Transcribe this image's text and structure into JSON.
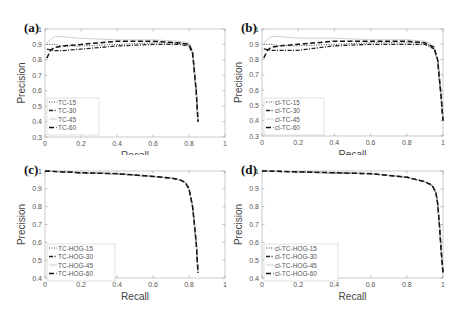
{
  "figure": {
    "panels": [
      {
        "id": "a",
        "label": "(a)",
        "xlabel": "Recall",
        "ylabel": "Precision",
        "ylim": [
          0.3,
          1
        ],
        "yticks": [
          "0.3",
          "0.4",
          "0.5",
          "0.6",
          "0.7",
          "0.8",
          "0.9",
          "1"
        ],
        "xticks": [
          "0",
          "0.2",
          "0.4",
          "0.6",
          "0.8",
          "1"
        ],
        "legend": [
          "TC-15",
          "TC-30",
          "TC-45",
          "TC-60"
        ]
      },
      {
        "id": "b",
        "label": "(b)",
        "xlabel": "Recall",
        "ylabel": "Precision",
        "ylim": [
          0.3,
          1
        ],
        "yticks": [
          "0.3",
          "0.4",
          "0.5",
          "0.6",
          "0.7",
          "0.8",
          "0.9",
          "1"
        ],
        "xticks": [
          "0",
          "0.2",
          "0.4",
          "0.6",
          "0.8",
          "1"
        ],
        "legend": [
          "cl-TC-15",
          "cl-TC-30",
          "cl-TC-45",
          "cl-TC-60"
        ]
      },
      {
        "id": "c",
        "label": "(c)",
        "xlabel": "Recall",
        "ylabel": "Precision",
        "ylim": [
          0.4,
          1
        ],
        "yticks": [
          "0.4",
          "0.5",
          "0.6",
          "0.7",
          "0.8",
          "0.9",
          "1"
        ],
        "xticks": [
          "0",
          "0.2",
          "0.4",
          "0.6",
          "0.8",
          "1"
        ],
        "legend": [
          "TC-HOG-15",
          "TC-HOG-30",
          "TC-HOG-45",
          "TC-HOG-60"
        ]
      },
      {
        "id": "d",
        "label": "(d)",
        "xlabel": "Recall",
        "ylabel": "Precision",
        "ylim": [
          0.4,
          1
        ],
        "yticks": [
          "0.4",
          "0.5",
          "0.6",
          "0.7",
          "0.8",
          "0.9",
          "1"
        ],
        "xticks": [
          "0",
          "0.2",
          "0.4",
          "0.6",
          "0.8",
          "1"
        ],
        "legend": [
          "cl-TC-HOG-15",
          "cl-TC-HOG-30",
          "cl-TC-HOG-45",
          "cl-TC-HOG-60"
        ]
      }
    ]
  },
  "chart_data": [
    {
      "type": "line",
      "title": "(a)",
      "xlabel": "Recall",
      "ylabel": "Precision",
      "xlim": [
        0,
        1
      ],
      "ylim": [
        0.3,
        1
      ],
      "grid": false,
      "legend_position": "lower left",
      "series": [
        {
          "name": "TC-15",
          "style": "dotted",
          "x": [
            0.01,
            0.05,
            0.1,
            0.2,
            0.4,
            0.6,
            0.75,
            0.8,
            0.82,
            0.84,
            0.85
          ],
          "y": [
            0.9,
            0.9,
            0.89,
            0.89,
            0.9,
            0.91,
            0.91,
            0.9,
            0.85,
            0.6,
            0.4
          ]
        },
        {
          "name": "TC-30",
          "style": "dashdot",
          "x": [
            0.01,
            0.05,
            0.1,
            0.2,
            0.4,
            0.6,
            0.75,
            0.8,
            0.82,
            0.84,
            0.85
          ],
          "y": [
            0.87,
            0.86,
            0.86,
            0.87,
            0.89,
            0.9,
            0.9,
            0.89,
            0.84,
            0.6,
            0.4
          ]
        },
        {
          "name": "TC-45",
          "style": "solid-light",
          "x": [
            0.01,
            0.05,
            0.1,
            0.2,
            0.4,
            0.6,
            0.75,
            0.8,
            0.82,
            0.84,
            0.85
          ],
          "y": [
            0.91,
            0.95,
            0.95,
            0.94,
            0.93,
            0.93,
            0.92,
            0.91,
            0.86,
            0.6,
            0.4
          ]
        },
        {
          "name": "TC-60",
          "style": "dashed",
          "x": [
            0.01,
            0.03,
            0.05,
            0.1,
            0.2,
            0.4,
            0.6,
            0.75,
            0.8,
            0.82,
            0.84,
            0.85
          ],
          "y": [
            0.81,
            0.86,
            0.88,
            0.89,
            0.9,
            0.92,
            0.92,
            0.91,
            0.9,
            0.85,
            0.6,
            0.4
          ]
        }
      ]
    },
    {
      "type": "line",
      "title": "(b)",
      "xlabel": "Recall",
      "ylabel": "Precision",
      "xlim": [
        0,
        1
      ],
      "ylim": [
        0.3,
        1
      ],
      "grid": false,
      "legend_position": "lower left",
      "series": [
        {
          "name": "cl-TC-15",
          "style": "dotted",
          "x": [
            0.01,
            0.05,
            0.1,
            0.2,
            0.4,
            0.6,
            0.8,
            0.9,
            0.95,
            0.97,
            0.99,
            1.0
          ],
          "y": [
            0.9,
            0.9,
            0.89,
            0.89,
            0.9,
            0.91,
            0.91,
            0.91,
            0.88,
            0.8,
            0.55,
            0.4
          ]
        },
        {
          "name": "cl-TC-30",
          "style": "dashdot",
          "x": [
            0.01,
            0.05,
            0.1,
            0.2,
            0.4,
            0.6,
            0.8,
            0.9,
            0.95,
            0.97,
            0.99,
            1.0
          ],
          "y": [
            0.87,
            0.86,
            0.86,
            0.86,
            0.89,
            0.9,
            0.9,
            0.9,
            0.87,
            0.8,
            0.55,
            0.4
          ]
        },
        {
          "name": "cl-TC-45",
          "style": "solid-light",
          "x": [
            0.01,
            0.05,
            0.1,
            0.2,
            0.4,
            0.6,
            0.8,
            0.9,
            0.95,
            0.97,
            0.99,
            1.0
          ],
          "y": [
            0.91,
            0.95,
            0.95,
            0.94,
            0.94,
            0.93,
            0.93,
            0.92,
            0.89,
            0.8,
            0.55,
            0.4
          ]
        },
        {
          "name": "cl-TC-60",
          "style": "dashed",
          "x": [
            0.01,
            0.03,
            0.05,
            0.1,
            0.2,
            0.4,
            0.6,
            0.8,
            0.9,
            0.95,
            0.97,
            0.99,
            1.0
          ],
          "y": [
            0.81,
            0.86,
            0.88,
            0.89,
            0.9,
            0.92,
            0.92,
            0.92,
            0.91,
            0.88,
            0.8,
            0.55,
            0.4
          ]
        }
      ]
    },
    {
      "type": "line",
      "title": "(c)",
      "xlabel": "Recall",
      "ylabel": "Precision",
      "xlim": [
        0,
        1
      ],
      "ylim": [
        0.4,
        1
      ],
      "grid": false,
      "legend_position": "lower left",
      "series": [
        {
          "name": "TC-HOG-15",
          "style": "dotted",
          "x": [
            0.0,
            0.1,
            0.2,
            0.4,
            0.6,
            0.7,
            0.75,
            0.78,
            0.8,
            0.82,
            0.84,
            0.85
          ],
          "y": [
            1.0,
            0.995,
            0.99,
            0.985,
            0.97,
            0.96,
            0.95,
            0.935,
            0.9,
            0.8,
            0.6,
            0.43
          ]
        },
        {
          "name": "TC-HOG-30",
          "style": "dashdot",
          "x": [
            0.0,
            0.1,
            0.2,
            0.4,
            0.6,
            0.7,
            0.75,
            0.78,
            0.8,
            0.82,
            0.84,
            0.85
          ],
          "y": [
            1.0,
            0.995,
            0.99,
            0.985,
            0.97,
            0.96,
            0.95,
            0.935,
            0.9,
            0.8,
            0.6,
            0.43
          ]
        },
        {
          "name": "TC-HOG-45",
          "style": "solid-light",
          "x": [
            0.0,
            0.1,
            0.2,
            0.4,
            0.6,
            0.7,
            0.75,
            0.78,
            0.8,
            0.82,
            0.84,
            0.85
          ],
          "y": [
            1.0,
            0.995,
            0.99,
            0.985,
            0.97,
            0.96,
            0.95,
            0.935,
            0.9,
            0.8,
            0.6,
            0.43
          ]
        },
        {
          "name": "TC-HOG-60",
          "style": "dashed",
          "x": [
            0.0,
            0.1,
            0.2,
            0.4,
            0.6,
            0.7,
            0.75,
            0.78,
            0.8,
            0.82,
            0.84,
            0.85
          ],
          "y": [
            1.0,
            0.995,
            0.99,
            0.985,
            0.97,
            0.96,
            0.95,
            0.935,
            0.9,
            0.8,
            0.6,
            0.43
          ]
        }
      ]
    },
    {
      "type": "line",
      "title": "(d)",
      "xlabel": "Recall",
      "ylabel": "Precision",
      "xlim": [
        0,
        1
      ],
      "ylim": [
        0.4,
        1
      ],
      "grid": false,
      "legend_position": "lower left",
      "series": [
        {
          "name": "cl-TC-HOG-15",
          "style": "dotted",
          "x": [
            0.0,
            0.2,
            0.4,
            0.6,
            0.8,
            0.9,
            0.94,
            0.96,
            0.97,
            0.98,
            0.99,
            1.0
          ],
          "y": [
            1.0,
            0.995,
            0.99,
            0.985,
            0.965,
            0.94,
            0.92,
            0.88,
            0.82,
            0.7,
            0.55,
            0.43
          ]
        },
        {
          "name": "cl-TC-HOG-30",
          "style": "dashdot",
          "x": [
            0.0,
            0.2,
            0.4,
            0.6,
            0.8,
            0.9,
            0.94,
            0.96,
            0.97,
            0.98,
            0.99,
            1.0
          ],
          "y": [
            1.0,
            0.995,
            0.99,
            0.985,
            0.965,
            0.94,
            0.92,
            0.88,
            0.82,
            0.7,
            0.55,
            0.43
          ]
        },
        {
          "name": "cl-TC-HOG-45",
          "style": "solid-light",
          "x": [
            0.0,
            0.2,
            0.4,
            0.6,
            0.8,
            0.9,
            0.94,
            0.96,
            0.97,
            0.98,
            0.99,
            1.0
          ],
          "y": [
            1.0,
            0.995,
            0.99,
            0.985,
            0.965,
            0.94,
            0.92,
            0.88,
            0.82,
            0.7,
            0.55,
            0.43
          ]
        },
        {
          "name": "cl-TC-HOG-60",
          "style": "dashed",
          "x": [
            0.0,
            0.2,
            0.4,
            0.6,
            0.8,
            0.9,
            0.94,
            0.96,
            0.97,
            0.98,
            0.99,
            1.0
          ],
          "y": [
            1.0,
            0.995,
            0.99,
            0.985,
            0.965,
            0.94,
            0.92,
            0.88,
            0.82,
            0.7,
            0.55,
            0.43
          ]
        }
      ]
    }
  ]
}
